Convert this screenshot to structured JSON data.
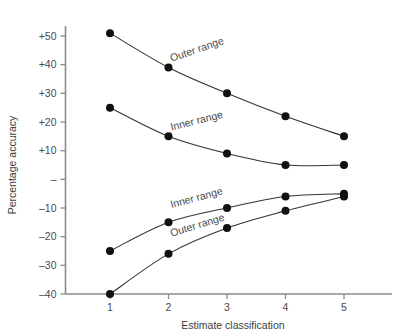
{
  "chart_data": {
    "type": "line",
    "title": "",
    "xlabel": "Estimate classification",
    "ylabel": "Percentage accuracy",
    "x": [
      1,
      2,
      3,
      4,
      5
    ],
    "xtick_labels": [
      "1",
      "2",
      "3",
      "4",
      "5"
    ],
    "xlim": [
      0.6,
      5.6
    ],
    "ylim": [
      -40,
      50
    ],
    "ytick_values": [
      50,
      40,
      30,
      20,
      10,
      0,
      -10,
      -20,
      -30,
      -40
    ],
    "ytick_labels": [
      "+50",
      "+40",
      "+30",
      "+20",
      "+10",
      "–",
      "–10",
      "–20",
      "–30",
      "–40"
    ],
    "grid": false,
    "legend": "inline-curve-labels",
    "series": [
      {
        "name": "Outer range (upper)",
        "label": "Outer range",
        "values": [
          51,
          39,
          30,
          22,
          15
        ],
        "label_x": 2.05,
        "label_y": 41,
        "label_rotate": -19
      },
      {
        "name": "Inner range (upper)",
        "label": "Inner range",
        "values": [
          25,
          15,
          9,
          5,
          5
        ],
        "label_x": 2.05,
        "label_y": 17,
        "label_rotate": -14
      },
      {
        "name": "Inner range (lower)",
        "label": "Inner range",
        "values": [
          -25,
          -15,
          -10,
          -6,
          -5
        ],
        "label_x": 2.05,
        "label_y": -10,
        "label_rotate": -15
      },
      {
        "name": "Outer range (lower)",
        "label": "Outer range",
        "values": [
          -40,
          -26,
          -17,
          -11,
          -6
        ],
        "label_x": 2.05,
        "label_y": -20,
        "label_rotate": -17
      }
    ]
  }
}
